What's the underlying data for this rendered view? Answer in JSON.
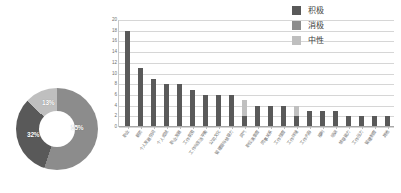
{
  "legend": {
    "position": "top-right",
    "items": [
      {
        "label": "积极",
        "color": "#595959",
        "name": "positive"
      },
      {
        "label": "消极",
        "color": "#8c8c8c",
        "name": "negative"
      },
      {
        "label": "中性",
        "color": "#bfbfbf",
        "name": "neutral"
      }
    ]
  },
  "chart_data": [
    {
      "type": "pie",
      "variant": "donut",
      "title": "",
      "labels": [
        "积极",
        "消极",
        "中性"
      ],
      "values": [
        55,
        32,
        13
      ],
      "value_labels": [
        "55%",
        "32%",
        "13%"
      ],
      "colors": [
        "#8c8c8c",
        "#595959",
        "#bfbfbf"
      ],
      "legend": "none",
      "grid": false
    },
    {
      "type": "bar",
      "stacked": true,
      "title": "",
      "xlabel": "",
      "ylabel": "",
      "ylim": [
        0,
        20
      ],
      "yticks": [
        0,
        2,
        4,
        6,
        8,
        10,
        12,
        14,
        16,
        18,
        20
      ],
      "ytick_labels": [
        "0",
        "2",
        "4",
        "6",
        "8",
        "10",
        "12",
        "14",
        "16",
        "18",
        "20"
      ],
      "grid": true,
      "categories": [
        "职业",
        "薪资",
        "个人发展空间",
        "个人成就",
        "职业发展",
        "工作氛围",
        "工作与生活平衡",
        "公司文化",
        "管理层与领导力",
        "风气",
        "职位满意度",
        "同事关系",
        "工作强度",
        "工作环境",
        "工作内容",
        "福利",
        "培训",
        "领导能力",
        "工作压力",
        "管理制度",
        "其他"
      ],
      "series": [
        {
          "name": "积极",
          "color": "#595959",
          "values": [
            18,
            11,
            9,
            8,
            8,
            7,
            6,
            6,
            6,
            2,
            4,
            4,
            4,
            2,
            3,
            3,
            3,
            2,
            2,
            2,
            2
          ]
        },
        {
          "name": "消极",
          "color": "#8c8c8c",
          "values": [
            0,
            0,
            0,
            0,
            0,
            0,
            0,
            0,
            0,
            0,
            0,
            0,
            0,
            0,
            0,
            0,
            0,
            0,
            0,
            0,
            0
          ]
        },
        {
          "name": "中性",
          "color": "#bfbfbf",
          "values": [
            0,
            0,
            0,
            0,
            0,
            0,
            0,
            0,
            0,
            3,
            0,
            0,
            0,
            2,
            0,
            0,
            0,
            0,
            0,
            0,
            0
          ]
        }
      ],
      "totals": [
        18,
        11,
        9,
        8,
        8,
        7,
        6,
        6,
        6,
        5,
        4,
        4,
        4,
        4,
        3,
        3,
        3,
        2,
        2,
        2,
        2
      ]
    }
  ]
}
